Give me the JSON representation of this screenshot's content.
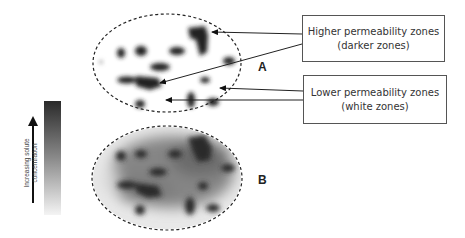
{
  "callouts": {
    "higher": {
      "line1": "Higher permeability zones",
      "line2": "(darker zones)"
    },
    "lower": {
      "line1": "Lower permeability zones",
      "line2": "(white zones)"
    }
  },
  "labels": {
    "a": "A",
    "b": "B"
  },
  "legend": {
    "line1": "Increasing solute",
    "line2": "concentration",
    "gradient_top": "#2a2a2a",
    "gradient_bottom": "#f4f4f4"
  }
}
